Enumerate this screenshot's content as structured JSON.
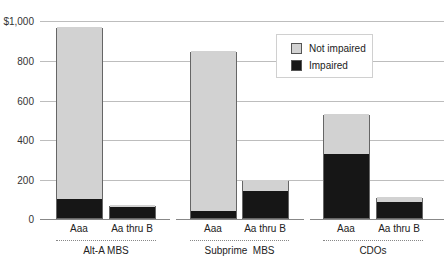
{
  "chart_data": {
    "type": "bar",
    "stacked": true,
    "title": "",
    "xlabel": "",
    "ylabel": "",
    "ylim": [
      0,
      1000
    ],
    "yticks": [
      "0",
      "200",
      "400",
      "600",
      "800",
      "$1,000"
    ],
    "grid": true,
    "legend_position": "top-right",
    "groups": [
      "Alt-A MBS",
      "Subprime  MBS",
      "CDOs"
    ],
    "categories": [
      "Aaa",
      "Aa thru B",
      "Aaa",
      "Aa thru B",
      "Aaa",
      "Aa thru B"
    ],
    "series": [
      {
        "name": "Impaired",
        "color": "#161616",
        "values": [
          96,
          57,
          35,
          136,
          323,
          81
        ]
      },
      {
        "name": "Not impaired",
        "color": "#d2d2d2",
        "values": [
          869,
          9,
          808,
          56,
          202,
          25
        ]
      }
    ],
    "totals": [
      965,
      66,
      843,
      192,
      525,
      106
    ]
  },
  "axis": {
    "ticks": [
      {
        "label": "$1,000",
        "y": 21
      },
      {
        "label": "800",
        "y": 61
      },
      {
        "label": "600",
        "y": 101
      },
      {
        "label": "400",
        "y": 140
      },
      {
        "label": "200",
        "y": 180
      },
      {
        "label": "0",
        "y": 219
      }
    ]
  },
  "legend": {
    "not_impaired": "Not impaired",
    "impaired": "Impaired"
  },
  "labels": {
    "bar0": "Aaa",
    "bar1": "Aa thru B",
    "bar2": "Aaa",
    "bar3": "Aa thru B",
    "bar4": "Aaa",
    "bar5": "Aa thru B",
    "group0": "Alt-A MBS",
    "group1": "Subprime  MBS",
    "group2": "CDOs"
  }
}
